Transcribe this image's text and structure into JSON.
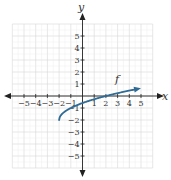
{
  "chart_data": {
    "type": "line",
    "title": "",
    "xlabel": "x",
    "ylabel": "y",
    "xlim": [
      -6,
      6
    ],
    "ylim": [
      -6,
      6
    ],
    "grid": true,
    "x_ticks": [
      -5,
      -4,
      -3,
      -2,
      -1,
      1,
      2,
      3,
      4,
      5
    ],
    "y_ticks": [
      -5,
      -4,
      -3,
      -2,
      -1,
      1,
      2,
      3,
      4,
      5
    ],
    "series": [
      {
        "name": "f",
        "label": "f",
        "color": "#2f6b94",
        "function": "sqrt(x+2)-2",
        "x": [
          -2,
          -1.5,
          -1,
          0,
          1,
          2,
          3,
          4,
          5
        ],
        "values": [
          -2,
          -1.29,
          -1,
          -0.59,
          -0.27,
          0,
          0.24,
          0.45,
          0.65
        ],
        "end_arrow": true
      }
    ]
  },
  "colors": {
    "axis": "#222222",
    "grid": "#d6d6d6",
    "curve": "#2f6b94"
  }
}
